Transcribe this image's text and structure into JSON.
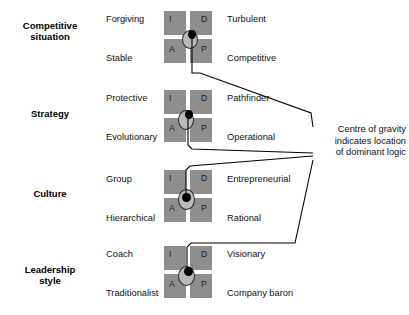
{
  "diagram": {
    "quadrant_labels": {
      "top_left": "I",
      "top_right": "D",
      "bottom_left": "A",
      "bottom_right": "P"
    },
    "colors": {
      "square_fill": "#8e8e8e",
      "cross": "#ffffff",
      "marker_dot": "#000000",
      "marker_ellipse": "#b9b9b9",
      "line": "#000000",
      "text": "#111111"
    },
    "annotation": {
      "line1": "Centre of gravity",
      "line2": "indicates location",
      "line3": "of dominant  logic"
    },
    "rows": [
      {
        "label_line1": "Competitive",
        "label_line2": "situation",
        "left_top": "Forgiving",
        "left_bottom": "Stable",
        "right_top": "Turbulent",
        "right_bottom": "Competitive"
      },
      {
        "label_line1": "Strategy",
        "label_line2": "",
        "left_top": "Protective",
        "left_bottom": "Evolutionary",
        "right_top": "Pathfinder",
        "right_bottom": "Operational"
      },
      {
        "label_line1": "Culture",
        "label_line2": "",
        "left_top": "Group",
        "left_bottom": "Hierarchical",
        "right_top": "Entrepreneurial",
        "right_bottom": "Rational"
      },
      {
        "label_line1": "Leadership",
        "label_line2": "style",
        "left_top": "Coach",
        "left_bottom": "Traditionalist",
        "right_top": "Visionary",
        "right_bottom": "Company baron"
      }
    ]
  }
}
